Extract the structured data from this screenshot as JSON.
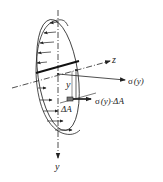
{
  "diagram": {
    "type": "bending-stress-cross-section",
    "labels": {
      "z_axis": "z",
      "y_axis": "y",
      "y_distance": "y",
      "sigma": "σ",
      "sigma_arg": "(y)",
      "sigma_full": "σ (y)",
      "force_label": "σ (y)·ΔA",
      "force_sigma": "σ",
      "force_arg": "(y)·",
      "force_area": "ΔA",
      "area_element": "ΔA"
    },
    "colors": {
      "stroke": "#222222",
      "background": "#ffffff",
      "area_fill": "#777777"
    }
  }
}
